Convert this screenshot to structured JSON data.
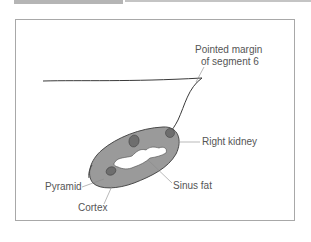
{
  "figure": {
    "type": "anatomical-illustration",
    "labels": {
      "pointed_margin_line1": "Pointed margin",
      "pointed_margin_line2": "of segment 6",
      "right_kidney": "Right kidney",
      "sinus_fat": "Sinus fat",
      "pyramid": "Pyramid",
      "cortex": "Cortex"
    },
    "colors": {
      "frame_border": "#a8a8a8",
      "kidney_fill": "#9a9a9a",
      "kidney_outline": "#4a4a4a",
      "pyramid_fill": "#6e6e6e",
      "sinus_fat_fill": "#ffffff",
      "liver_outline": "#3a3a3a",
      "leader_line": "#8a8a8a",
      "label_text": "#555555",
      "top_band_dark": "#b5b5b5",
      "top_band_light": "#c4c4c4"
    }
  }
}
